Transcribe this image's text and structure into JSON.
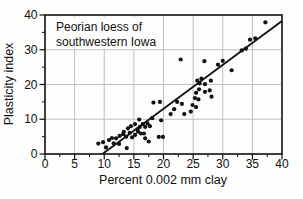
{
  "figure": {
    "annotation_line1": "Peorian loess of",
    "annotation_line2": "southwestern Iowa",
    "x_axis_title": "Percent 0.002 mm clay",
    "y_axis_title": "Plasticity index"
  },
  "chart_data": {
    "type": "scatter",
    "title": "",
    "annotation": "Peorian loess of southwestern Iowa",
    "xlabel": "Percent 0.002 mm clay",
    "ylabel": "Plasticity index",
    "xlim": [
      0,
      40
    ],
    "ylim": [
      0,
      40
    ],
    "x_major_ticks": [
      0,
      5,
      10,
      15,
      20,
      25,
      30,
      35,
      40
    ],
    "y_major_ticks": [
      0,
      10,
      20,
      30,
      40
    ],
    "x_minor_step": 2.5,
    "y_minor_step": 5,
    "grid": true,
    "legend_position": "none",
    "point_color": "#111111",
    "line_color": "#111111",
    "grid_color": "#b9b9b9",
    "frame_color": "#111111",
    "trend_line": {
      "x1": 9.7,
      "y1": 0,
      "x2": 40,
      "y2": 38.3
    },
    "points": [
      [
        9.0,
        3.0
      ],
      [
        9.8,
        3.4
      ],
      [
        10.3,
        1.9
      ],
      [
        10.8,
        4.0
      ],
      [
        11.3,
        4.6
      ],
      [
        11.6,
        3.1
      ],
      [
        12.0,
        4.5
      ],
      [
        12.5,
        2.9
      ],
      [
        12.6,
        5.2
      ],
      [
        13.2,
        5.7
      ],
      [
        13.7,
        5.0
      ],
      [
        13.8,
        1.7
      ],
      [
        14.3,
        6.1
      ],
      [
        14.7,
        4.8
      ],
      [
        15.2,
        5.5
      ],
      [
        15.7,
        6.4
      ],
      [
        16.2,
        5.9
      ],
      [
        16.7,
        5.9
      ],
      [
        16.9,
        4.5
      ],
      [
        17.5,
        3.6
      ],
      [
        19.2,
        4.9
      ],
      [
        19.9,
        4.9
      ],
      [
        13.3,
        6.4
      ],
      [
        14.0,
        7.4
      ],
      [
        14.5,
        8.0
      ],
      [
        15.2,
        8.6
      ],
      [
        15.6,
        7.1
      ],
      [
        16.0,
        7.8
      ],
      [
        16.5,
        8.6
      ],
      [
        16.9,
        7.8
      ],
      [
        17.3,
        8.8
      ],
      [
        17.7,
        8.0
      ],
      [
        15.9,
        9.9
      ],
      [
        18.1,
        10.3
      ],
      [
        19.6,
        9.7
      ],
      [
        18.3,
        14.8
      ],
      [
        19.4,
        15.0
      ],
      [
        21.2,
        11.5
      ],
      [
        21.8,
        12.9
      ],
      [
        23.5,
        11.5
      ],
      [
        24.6,
        12.2
      ],
      [
        22.3,
        15.0
      ],
      [
        23.1,
        14.4
      ],
      [
        24.9,
        14.1
      ],
      [
        25.5,
        13.5
      ],
      [
        25.3,
        16.1
      ],
      [
        25.9,
        15.7
      ],
      [
        25.5,
        17.6
      ],
      [
        26.0,
        18.6
      ],
      [
        26.1,
        20.3
      ],
      [
        25.7,
        21.1
      ],
      [
        26.4,
        21.7
      ],
      [
        27.0,
        20.1
      ],
      [
        27.0,
        17.9
      ],
      [
        27.8,
        18.3
      ],
      [
        28.0,
        21.1
      ],
      [
        28.1,
        16.5
      ],
      [
        22.9,
        27.2
      ],
      [
        26.9,
        26.7
      ],
      [
        29.2,
        25.7
      ],
      [
        30.0,
        26.8
      ],
      [
        31.5,
        24.1
      ],
      [
        33.2,
        29.8
      ],
      [
        33.9,
        30.3
      ],
      [
        34.6,
        32.9
      ],
      [
        35.5,
        33.3
      ],
      [
        37.2,
        37.9
      ]
    ]
  }
}
